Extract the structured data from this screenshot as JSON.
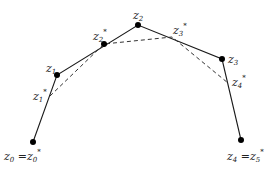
{
  "diagram": {
    "type": "polyline-approximation",
    "colors": {
      "line": "#1a1a1a",
      "dashed": "#333333",
      "point": "#000000",
      "text": "#222222"
    },
    "points": [
      {
        "id": "z0",
        "x": 33,
        "y": 142,
        "marked": true
      },
      {
        "id": "z1",
        "x": 57,
        "y": 75,
        "marked": true
      },
      {
        "id": "z2",
        "x": 138,
        "y": 25,
        "marked": true
      },
      {
        "id": "z3",
        "x": 222,
        "y": 59,
        "marked": true
      },
      {
        "id": "z4",
        "x": 241,
        "y": 140,
        "marked": true
      }
    ],
    "star_points": [
      {
        "id": "z1*",
        "x": 50,
        "y": 96,
        "marked": false
      },
      {
        "id": "z2*",
        "x": 104,
        "y": 44,
        "marked": true
      },
      {
        "id": "z3*",
        "x": 172,
        "y": 37,
        "marked": false
      },
      {
        "id": "z4*",
        "x": 228,
        "y": 83,
        "marked": false
      }
    ],
    "solid_path": [
      "z0",
      "z1",
      "z2",
      "z3",
      "z4"
    ],
    "dashed_path": [
      "z1*",
      "z2*",
      "z3*",
      "z4*"
    ],
    "labels": {
      "z0": {
        "base": "z",
        "sub": "0",
        "suffix": " =",
        "base2": "z",
        "sub2": "0",
        "sup2": "*"
      },
      "z1": {
        "base": "z",
        "sub": "1"
      },
      "z1s": {
        "base": "z",
        "sub": "1",
        "sup": "*"
      },
      "z2": {
        "base": "z",
        "sub": "2"
      },
      "z2s": {
        "base": "z",
        "sub": "2",
        "sup": "*"
      },
      "z3": {
        "base": "z",
        "sub": "3"
      },
      "z3s": {
        "base": "z",
        "sub": "3",
        "sup": "*"
      },
      "z4s": {
        "base": "z",
        "sub": "4",
        "sup": "*"
      },
      "z4": {
        "base": "z",
        "sub": "4",
        "suffix": " =",
        "base2": "z",
        "sub2": "5",
        "sup2": "*"
      }
    }
  }
}
